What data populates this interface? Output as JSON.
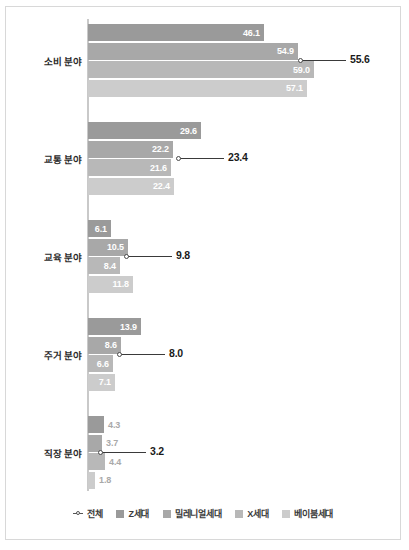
{
  "chart_data": {
    "type": "bar",
    "orientation": "horizontal",
    "title": "",
    "xlabel": "",
    "ylabel": "",
    "grid": false,
    "xlim": [
      0,
      62
    ],
    "legend_position": "bottom",
    "categories": [
      "소비 분야",
      "교통 분야",
      "교육 분야",
      "주거 분야",
      "직장 분야"
    ],
    "series": [
      {
        "name": "Z세대",
        "color": "#9a9a9a",
        "values": [
          46.1,
          29.6,
          6.1,
          13.9,
          4.3
        ]
      },
      {
        "name": "밀레니얼세대",
        "color": "#a8a8a8",
        "values": [
          54.9,
          22.2,
          10.5,
          8.6,
          3.7
        ]
      },
      {
        "name": "X세대",
        "color": "#b8b8b8",
        "values": [
          59.0,
          21.6,
          8.4,
          6.6,
          4.4
        ]
      },
      {
        "name": "베이붐세대",
        "color": "#cccccc",
        "values": [
          57.1,
          22.4,
          11.8,
          7.1,
          1.8
        ]
      }
    ],
    "overlay_series": {
      "name": "전체",
      "marker": "line-circle",
      "color": "#3a3a3a",
      "values": [
        55.6,
        23.4,
        9.8,
        8.0,
        3.2
      ]
    }
  },
  "legend": {
    "items": [
      {
        "label": "전체",
        "marker": "line-circle-marker",
        "color": "#555555"
      },
      {
        "label": "Z세대",
        "marker": "square-swatch",
        "color": "#9a9a9a"
      },
      {
        "label": "밀레니얼세대",
        "marker": "square-swatch",
        "color": "#a8a8a8"
      },
      {
        "label": "X세대",
        "marker": "square-swatch",
        "color": "#b8b8b8"
      },
      {
        "label": "베이붐세대",
        "marker": "square-swatch",
        "color": "#cccccc"
      }
    ]
  },
  "groups": [
    {
      "label": "소비 분야",
      "top": 17,
      "total": {
        "value": "55.6",
        "px": 212
      },
      "bars": [
        {
          "value": "46.1",
          "px": 176,
          "color": "#9a9a9a",
          "inside": true
        },
        {
          "value": "54.9",
          "px": 210,
          "color": "#a8a8a8",
          "inside": true
        },
        {
          "value": "59.0",
          "px": 226,
          "color": "#b8b8b8",
          "inside": true
        },
        {
          "value": "57.1",
          "px": 219,
          "color": "#cccccc",
          "inside": true
        }
      ]
    },
    {
      "label": "교통 분야",
      "top": 115,
      "total": {
        "value": "23.4",
        "px": 90
      },
      "bars": [
        {
          "value": "29.6",
          "px": 113,
          "color": "#9a9a9a",
          "inside": true
        },
        {
          "value": "22.2",
          "px": 85,
          "color": "#a8a8a8",
          "inside": true
        },
        {
          "value": "21.6",
          "px": 83,
          "color": "#b8b8b8",
          "inside": true
        },
        {
          "value": "22.4",
          "px": 86,
          "color": "#cccccc",
          "inside": true
        }
      ]
    },
    {
      "label": "교육 분야",
      "top": 213,
      "total": {
        "value": "9.8",
        "px": 38
      },
      "bars": [
        {
          "value": "6.1",
          "px": 23,
          "color": "#9a9a9a",
          "inside": true
        },
        {
          "value": "10.5",
          "px": 40,
          "color": "#a8a8a8",
          "inside": true
        },
        {
          "value": "8.4",
          "px": 32,
          "color": "#b8b8b8",
          "inside": true
        },
        {
          "value": "11.8",
          "px": 45,
          "color": "#cccccc",
          "inside": true
        }
      ]
    },
    {
      "label": "주거 분야",
      "top": 311,
      "total": {
        "value": "8.0",
        "px": 31
      },
      "bars": [
        {
          "value": "13.9",
          "px": 53,
          "color": "#9a9a9a",
          "inside": true
        },
        {
          "value": "8.6",
          "px": 33,
          "color": "#a8a8a8",
          "inside": true
        },
        {
          "value": "6.6",
          "px": 25,
          "color": "#b8b8b8",
          "inside": true
        },
        {
          "value": "7.1",
          "px": 27,
          "color": "#cccccc",
          "inside": true
        }
      ]
    },
    {
      "label": "직장 분야",
      "top": 409,
      "total": {
        "value": "3.2",
        "px": 12
      },
      "bars": [
        {
          "value": "4.3",
          "px": 16,
          "color": "#9a9a9a",
          "inside": false
        },
        {
          "value": "3.7",
          "px": 14,
          "color": "#a8a8a8",
          "inside": false
        },
        {
          "value": "4.4",
          "px": 17,
          "color": "#b8b8b8",
          "inside": false
        },
        {
          "value": "1.8",
          "px": 7,
          "color": "#cccccc",
          "inside": false
        }
      ]
    }
  ]
}
